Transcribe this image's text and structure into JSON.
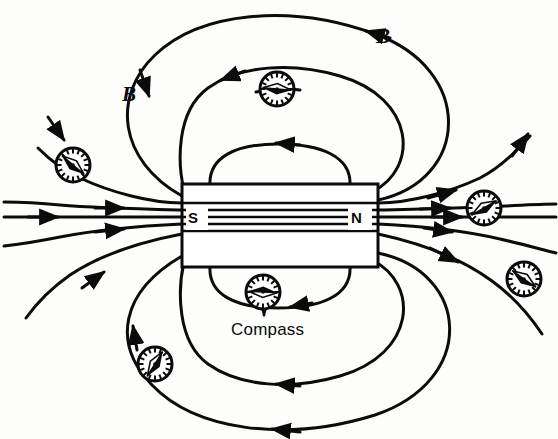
{
  "figure": {
    "type": "physics-diagram",
    "background_color": "#fdfdfb",
    "ink_color": "#0b0b0b"
  },
  "magnet": {
    "name": "bar-magnet",
    "south_pole_label": "S",
    "north_pole_label": "N",
    "rect": {
      "x": 182,
      "y": 184,
      "width": 196,
      "height": 83
    },
    "south_label_pos": {
      "x": 190,
      "y": 218
    },
    "north_label_pos": {
      "x": 352,
      "y": 218
    },
    "interior_line_count": 5
  },
  "field_labels": [
    {
      "id": "b-left",
      "text": "B",
      "x": 122,
      "y": 82
    },
    {
      "id": "b-right",
      "text": "B",
      "x": 376,
      "y": 24
    }
  ],
  "annotations": [
    {
      "id": "compass-callout",
      "text": "Compass",
      "x": 231,
      "y": 320,
      "leader_from": {
        "x": 264,
        "y": 300
      },
      "leader_to": {
        "x": 264,
        "y": 318
      }
    }
  ],
  "compasses": [
    {
      "id": "compass-top",
      "cx": 277,
      "cy": 89,
      "r": 17,
      "needle_angle_deg": 5,
      "label": ""
    },
    {
      "id": "compass-upper-left",
      "cx": 73,
      "cy": 165,
      "r": 17,
      "needle_angle_deg": 40,
      "label": ""
    },
    {
      "id": "compass-right-upper",
      "cx": 484,
      "cy": 208,
      "r": 17,
      "needle_angle_deg": -30,
      "label": ""
    },
    {
      "id": "compass-right-lower",
      "cx": 524,
      "cy": 279,
      "r": 17,
      "needle_angle_deg": 35,
      "label": ""
    },
    {
      "id": "compass-bottom-center",
      "cx": 263,
      "cy": 292,
      "r": 17,
      "needle_angle_deg": 183,
      "label": "Compass"
    },
    {
      "id": "compass-bottom-left",
      "cx": 155,
      "cy": 364,
      "r": 17,
      "needle_angle_deg": -58,
      "label": ""
    }
  ],
  "field_direction_note": {
    "out_of_north": "right",
    "into_south": "right",
    "loop_return_top": "leftward",
    "loop_return_bottom": "leftward"
  },
  "legend": {
    "b_symbol_meaning": "B",
    "south_pole": "S",
    "north_pole": "N",
    "compass_label": "Compass"
  }
}
